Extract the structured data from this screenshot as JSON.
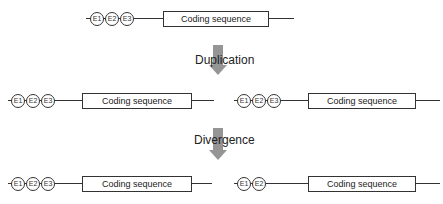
{
  "steps": {
    "duplication_label": "Duplication",
    "divergence_label": "Divergence"
  },
  "genes": {
    "original": {
      "enhancers": [
        "E1",
        "E2",
        "E3"
      ],
      "cds_label": "Coding sequence"
    },
    "dup_left": {
      "enhancers": [
        "E1",
        "E2",
        "E3"
      ],
      "cds_label": "Coding sequence"
    },
    "dup_right": {
      "enhancers": [
        "E1",
        "E2",
        "E3"
      ],
      "cds_label": "Coding sequence"
    },
    "div_left": {
      "enhancers": [
        "E1",
        "E2",
        "E3"
      ],
      "cds_label": "Coding sequence"
    },
    "div_right": {
      "enhancers": [
        "E1",
        "E2"
      ],
      "cds_label": "Coding sequence"
    }
  },
  "colors": {
    "arrow": "#8a8a8a",
    "line": "#333333"
  }
}
